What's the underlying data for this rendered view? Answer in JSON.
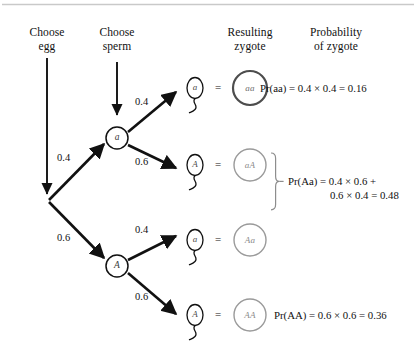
{
  "diagram": {
    "type": "probability-tree",
    "title_rule": true,
    "headers": [
      {
        "name": "choose-egg",
        "line1": "Choose",
        "line2": "egg"
      },
      {
        "name": "choose-sperm",
        "line1": "Choose",
        "line2": "sperm"
      },
      {
        "name": "resulting-zygote",
        "line1": "Resulting",
        "line2": "zygote"
      },
      {
        "name": "probability-of-zygote",
        "line1": "Probability",
        "line2": "of zygote"
      }
    ],
    "egg_branches": [
      {
        "allele": "a",
        "prob": "0.4"
      },
      {
        "allele": "A",
        "prob": "0.6"
      }
    ],
    "sperm_branches": [
      {
        "allele": "a",
        "prob": "0.4"
      },
      {
        "allele": "A",
        "prob": "0.6"
      },
      {
        "allele": "a",
        "prob": "0.4"
      },
      {
        "allele": "A",
        "prob": "0.6"
      }
    ],
    "equals_sign": "=",
    "zygotes": [
      {
        "genotype": "aa",
        "emphasis": "dark"
      },
      {
        "genotype": "aA",
        "emphasis": "light"
      },
      {
        "genotype": "Aa",
        "emphasis": "light"
      },
      {
        "genotype": "AA",
        "emphasis": "light"
      }
    ],
    "equations": [
      {
        "name": "pr-aa",
        "line1": "Pr(aa) = 0.4 × 0.4 = 0.16",
        "line2": ""
      },
      {
        "name": "pr-Aa",
        "line1": "Pr(Aa) = 0.4 × 0.6 +",
        "line2": "0.6 × 0.4 = 0.48"
      },
      {
        "name": "pr-AA",
        "line1": "Pr(AA) = 0.6 × 0.6 = 0.36",
        "line2": ""
      }
    ]
  },
  "colors": {
    "ink": "#1a1a1a",
    "rule": "#c9c9c9",
    "zygote_dark": "#4d4d4d",
    "zygote_light": "#9a9a9a",
    "node_stroke": "#111111"
  }
}
